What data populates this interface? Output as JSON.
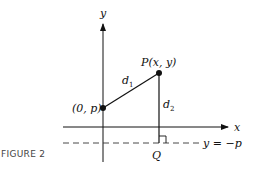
{
  "figure": {
    "caption": "FIGURE 2",
    "axes": {
      "x_label": "x",
      "y_label": "y"
    },
    "points": {
      "focus": {
        "label": "(0, p)"
      },
      "P": {
        "label": "P(x, y)"
      },
      "Q": {
        "label": "Q"
      }
    },
    "segments": {
      "d1": {
        "label": "d",
        "sub": "1"
      },
      "d2": {
        "label": "d",
        "sub": "2"
      }
    },
    "directrix": {
      "label": "y = −p"
    },
    "colors": {
      "ink": "#111111",
      "caption": "#444444"
    }
  }
}
